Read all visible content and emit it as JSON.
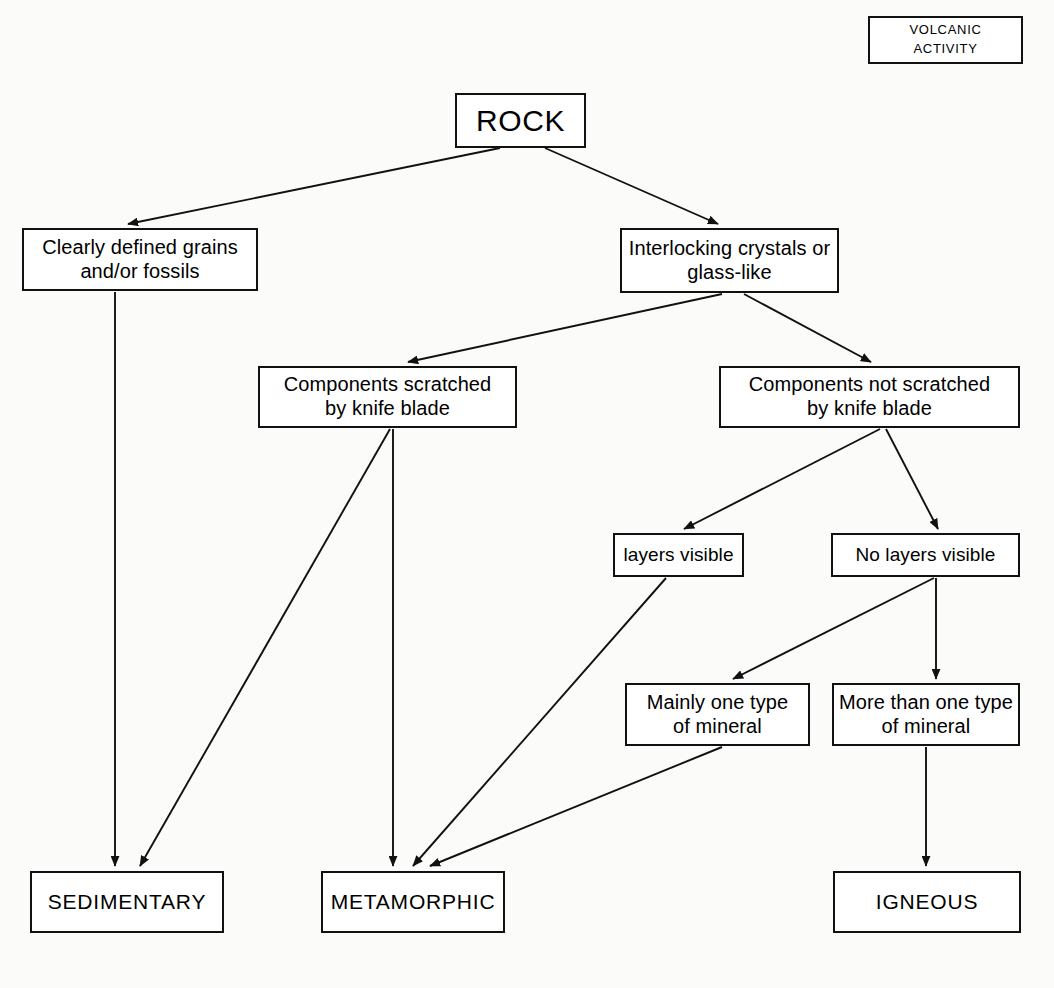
{
  "diagram": {
    "type": "flowchart",
    "background_color": "#fbfbfa",
    "line_color": "#111111",
    "box_fill": "#ffffff"
  },
  "nodes": {
    "volcanic_activity": {
      "label": "VOLCANIC\nACTIVITY",
      "x": 868,
      "y": 16,
      "w": 155,
      "h": 48
    },
    "rock": {
      "label": "ROCK",
      "x": 455,
      "y": 93,
      "w": 131,
      "h": 55
    },
    "clearly_defined": {
      "label": "Clearly defined grains\nand/or fossils",
      "x": 22,
      "y": 228,
      "w": 236,
      "h": 63
    },
    "interlocking": {
      "label": "Interlocking crystals or\nglass-like",
      "x": 620,
      "y": 228,
      "w": 219,
      "h": 65
    },
    "scratched": {
      "label": "Components scratched\nby knife blade",
      "x": 258,
      "y": 366,
      "w": 259,
      "h": 62
    },
    "not_scratched": {
      "label": "Components not scratched\nby knife blade",
      "x": 719,
      "y": 366,
      "w": 301,
      "h": 62
    },
    "layers_visible": {
      "label": "layers visible",
      "x": 613,
      "y": 533,
      "w": 131,
      "h": 44
    },
    "no_layers": {
      "label": "No layers visible",
      "x": 831,
      "y": 533,
      "w": 189,
      "h": 44
    },
    "mainly_one": {
      "label": "Mainly one type\nof mineral",
      "x": 625,
      "y": 683,
      "w": 185,
      "h": 63
    },
    "more_than_one": {
      "label": "More than one type\nof mineral",
      "x": 832,
      "y": 683,
      "w": 188,
      "h": 63
    },
    "sedimentary": {
      "label": "SEDIMENTARY",
      "x": 30,
      "y": 871,
      "w": 194,
      "h": 62
    },
    "metamorphic": {
      "label": "METAMORPHIC",
      "x": 321,
      "y": 871,
      "w": 184,
      "h": 62
    },
    "igneous": {
      "label": "IGNEOUS",
      "x": 833,
      "y": 871,
      "w": 188,
      "h": 62
    }
  },
  "edges": [
    {
      "name": "rock-to-clearly-defined",
      "from": "rock",
      "to": "clearly_defined",
      "points": "500,148 128,224"
    },
    {
      "name": "rock-to-interlocking",
      "from": "rock",
      "to": "interlocking",
      "points": "545,148 718,224"
    },
    {
      "name": "clearly-defined-to-sedimentary",
      "from": "clearly_defined",
      "to": "sedimentary",
      "points": "115,292 115,866"
    },
    {
      "name": "interlocking-to-scratched",
      "from": "interlocking",
      "to": "scratched",
      "points": "722,294 408,362"
    },
    {
      "name": "interlocking-to-not-scratched",
      "from": "interlocking",
      "to": "not_scratched",
      "points": "744,294 871,362"
    },
    {
      "name": "scratched-to-sedimentary",
      "from": "scratched",
      "to": "sedimentary",
      "points": "390,429 140,866"
    },
    {
      "name": "scratched-to-metamorphic",
      "from": "scratched",
      "to": "metamorphic",
      "points": "393,429 393,866"
    },
    {
      "name": "not-scratched-to-layers-visible",
      "from": "not_scratched",
      "to": "layers_visible",
      "points": "880,429 684,529"
    },
    {
      "name": "not-scratched-to-no-layers",
      "from": "not_scratched",
      "to": "no_layers",
      "points": "886,429 938,529"
    },
    {
      "name": "layers-visible-to-metamorphic",
      "from": "layers_visible",
      "to": "metamorphic",
      "points": "666,578 413,866"
    },
    {
      "name": "no-layers-to-mainly-one",
      "from": "no_layers",
      "to": "mainly_one",
      "points": "934,578 733,679"
    },
    {
      "name": "no-layers-to-more-than-one",
      "from": "no_layers",
      "to": "more_than_one",
      "points": "936,578 936,679"
    },
    {
      "name": "mainly-one-to-metamorphic",
      "from": "mainly_one",
      "to": "metamorphic",
      "points": "722,747 430,866"
    },
    {
      "name": "more-than-one-to-igneous",
      "from": "more_than_one",
      "to": "igneous",
      "points": "926,747 926,866"
    }
  ]
}
